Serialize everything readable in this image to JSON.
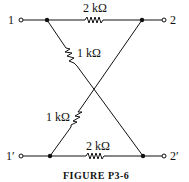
{
  "figure": {
    "caption": "FIGURE P3-6",
    "terminals": {
      "t1": "1",
      "t2": "2",
      "t1p": "1′",
      "t2p": "2′"
    },
    "resistors": {
      "top": "2 kΩ",
      "bottom": "2 kΩ",
      "diag_upper": "1 kΩ",
      "diag_lower": "1 kΩ"
    }
  }
}
